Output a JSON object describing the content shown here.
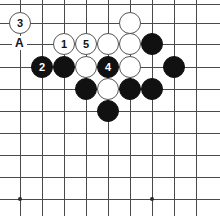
{
  "diagram": {
    "kind": "go-board-problem-diagram",
    "width": 220,
    "height": 216,
    "background_color": "#ffffff",
    "line_color": "#4a4a4a",
    "black_stone_color": "#111111",
    "white_stone_color": "#ffffff",
    "white_stone_border_color": "#555555",
    "black_number_color": "#ffffff",
    "white_number_color": "#111111"
  },
  "board": {
    "columns_x": [
      20,
      42,
      64,
      86,
      108,
      130,
      152,
      174,
      196
    ],
    "rows_y": [
      4,
      23,
      44,
      67,
      89,
      111,
      133,
      155,
      177,
      199
    ],
    "spacing": 22,
    "star_points": [
      {
        "x": 20,
        "y": 199
      },
      {
        "x": 152,
        "y": 199
      }
    ]
  },
  "stones": [
    {
      "name": "white-stone-move-3",
      "color": "white",
      "x": 20,
      "y": 23,
      "label": "3"
    },
    {
      "name": "white-stone-top",
      "color": "white",
      "x": 130,
      "y": 23,
      "label": ""
    },
    {
      "name": "white-stone-move-1",
      "color": "white",
      "x": 64,
      "y": 44,
      "label": "1"
    },
    {
      "name": "white-stone-move-5",
      "color": "white",
      "x": 86,
      "y": 44,
      "label": "5"
    },
    {
      "name": "white-stone-c3",
      "color": "white",
      "x": 108,
      "y": 44,
      "label": ""
    },
    {
      "name": "white-stone-d3",
      "color": "white",
      "x": 130,
      "y": 44,
      "label": ""
    },
    {
      "name": "black-stone-e3",
      "color": "black",
      "x": 152,
      "y": 44,
      "label": ""
    },
    {
      "name": "black-stone-move-2",
      "color": "black",
      "x": 42,
      "y": 67,
      "label": "2"
    },
    {
      "name": "black-stone-b4",
      "color": "black",
      "x": 64,
      "y": 67,
      "label": ""
    },
    {
      "name": "white-stone-c4",
      "color": "white",
      "x": 86,
      "y": 67,
      "label": ""
    },
    {
      "name": "black-stone-move-4",
      "color": "black",
      "x": 108,
      "y": 67,
      "label": "4"
    },
    {
      "name": "white-stone-e4",
      "color": "white",
      "x": 130,
      "y": 67,
      "label": ""
    },
    {
      "name": "black-stone-g4",
      "color": "black",
      "x": 174,
      "y": 67,
      "label": ""
    },
    {
      "name": "black-stone-c5",
      "color": "black",
      "x": 86,
      "y": 89,
      "label": ""
    },
    {
      "name": "white-stone-d5",
      "color": "white",
      "x": 108,
      "y": 89,
      "label": ""
    },
    {
      "name": "black-stone-e5",
      "color": "black",
      "x": 130,
      "y": 89,
      "label": ""
    },
    {
      "name": "black-stone-f5",
      "color": "black",
      "x": 152,
      "y": 89,
      "label": ""
    },
    {
      "name": "black-stone-d6",
      "color": "black",
      "x": 108,
      "y": 111,
      "label": ""
    }
  ],
  "markers": [
    {
      "name": "point-label-a",
      "text": "A",
      "x": 20,
      "y": 44
    }
  ]
}
